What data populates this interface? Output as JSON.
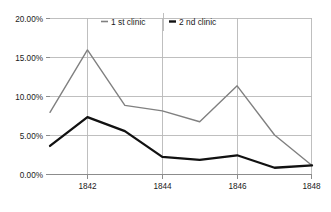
{
  "chart_data": {
    "type": "line",
    "title": "",
    "subtitle": "",
    "xlabel": "",
    "ylabel": "",
    "x": [
      1841,
      1842,
      1843,
      1844,
      1845,
      1846,
      1847,
      1848
    ],
    "xtick_labels": [
      "1842",
      "1844",
      "1846",
      "1848"
    ],
    "xtick_values": [
      1842,
      1844,
      1846,
      1848
    ],
    "xlim": [
      1841,
      1848
    ],
    "ytick_labels": [
      "0.00%",
      "5.00%",
      "10.00%",
      "15.00%",
      "20.00%"
    ],
    "ytick_values": [
      0,
      5,
      10,
      15,
      20
    ],
    "ylim": [
      0,
      20
    ],
    "grid": true,
    "legend_position": "top-center",
    "series": [
      {
        "name": "1 st clinic",
        "color": "#808080",
        "width": 1.4,
        "values": [
          7.9,
          15.9,
          8.8,
          8.1,
          6.7,
          11.3,
          5.0,
          1.1
        ]
      },
      {
        "name": "2 nd clinic",
        "color": "#111111",
        "width": 2.3,
        "values": [
          3.6,
          7.3,
          5.5,
          2.2,
          1.8,
          2.4,
          0.8,
          1.1
        ]
      }
    ]
  },
  "legend": {
    "items": [
      {
        "label": "1 st clinic",
        "color": "#808080",
        "marker": "line-marker"
      },
      {
        "label": "2 nd clinic",
        "color": "#111111",
        "marker": "line-marker"
      }
    ]
  },
  "axes": {
    "y_labels": [
      "20.00%",
      "15.00%",
      "10.00%",
      "5.00%",
      "0.00%"
    ],
    "x_labels": [
      "1842",
      "1844",
      "1846",
      "1848"
    ]
  }
}
